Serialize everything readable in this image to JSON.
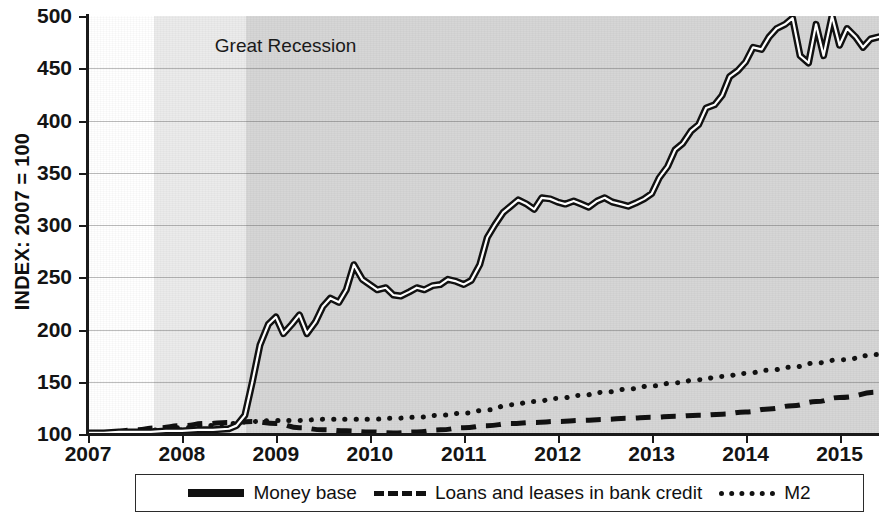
{
  "chart_data": {
    "type": "line",
    "title": "",
    "xlabel": "",
    "ylabel": "INDEX: 2007 = 100",
    "xlim": [
      2007,
      2015.42
    ],
    "ylim": [
      100,
      500
    ],
    "yticks": [
      100,
      150,
      200,
      250,
      300,
      350,
      400,
      450,
      500
    ],
    "xticks": [
      "2007",
      "2008",
      "2009",
      "2010",
      "2011",
      "2012",
      "2013",
      "2014",
      "2015"
    ],
    "grid": true,
    "legend_position": "bottom",
    "annotations": [
      {
        "text": "Great Recession",
        "x": 2008.35,
        "y": 470
      }
    ],
    "shaded_regions": [
      {
        "name": "recession-light-band",
        "x0": 2007.7,
        "x1": 2008.68,
        "color": "#ebebeb"
      },
      {
        "name": "post-recession-dark-band",
        "x0": 2008.68,
        "x1": 2015.42,
        "color": "#d6d6d6"
      }
    ],
    "series": [
      {
        "name": "Money base",
        "style": "solid",
        "color": "#111111",
        "x": [
          2007.0,
          2007.17,
          2007.33,
          2007.5,
          2007.67,
          2007.83,
          2008.0,
          2008.17,
          2008.33,
          2008.5,
          2008.58,
          2008.67,
          2008.75,
          2008.83,
          2008.92,
          2009.0,
          2009.08,
          2009.17,
          2009.25,
          2009.33,
          2009.42,
          2009.5,
          2009.58,
          2009.67,
          2009.75,
          2009.83,
          2009.92,
          2010.0,
          2010.08,
          2010.17,
          2010.25,
          2010.33,
          2010.42,
          2010.5,
          2010.58,
          2010.67,
          2010.75,
          2010.83,
          2010.92,
          2011.0,
          2011.08,
          2011.17,
          2011.25,
          2011.33,
          2011.42,
          2011.5,
          2011.58,
          2011.67,
          2011.75,
          2011.83,
          2011.92,
          2012.0,
          2012.08,
          2012.17,
          2012.25,
          2012.33,
          2012.42,
          2012.5,
          2012.58,
          2012.67,
          2012.75,
          2012.83,
          2012.92,
          2013.0,
          2013.08,
          2013.17,
          2013.25,
          2013.33,
          2013.42,
          2013.5,
          2013.58,
          2013.67,
          2013.75,
          2013.83,
          2013.92,
          2014.0,
          2014.08,
          2014.17,
          2014.25,
          2014.33,
          2014.42,
          2014.5,
          2014.58,
          2014.67,
          2014.75,
          2014.83,
          2014.92,
          2015.0,
          2015.08,
          2015.17,
          2015.25,
          2015.33,
          2015.42
        ],
        "values": [
          101,
          101,
          102,
          102,
          102,
          103,
          103,
          104,
          104,
          105,
          108,
          118,
          150,
          185,
          205,
          212,
          196,
          205,
          214,
          196,
          207,
          222,
          230,
          226,
          238,
          262,
          248,
          243,
          238,
          240,
          233,
          232,
          236,
          240,
          238,
          242,
          243,
          248,
          246,
          243,
          247,
          262,
          288,
          300,
          312,
          318,
          324,
          320,
          315,
          326,
          325,
          322,
          320,
          323,
          320,
          317,
          323,
          326,
          322,
          320,
          318,
          321,
          325,
          330,
          345,
          356,
          372,
          378,
          390,
          396,
          412,
          415,
          424,
          442,
          448,
          456,
          470,
          468,
          480,
          488,
          492,
          498,
          462,
          455,
          492,
          462,
          500,
          472,
          488,
          480,
          470,
          478,
          480
        ],
        "note": "Monetary base, double-stroke black line"
      },
      {
        "name": "Loans and leases in bank credit",
        "style": "dashed",
        "color": "#111111",
        "x": [
          2007.0,
          2007.25,
          2007.5,
          2007.75,
          2008.0,
          2008.25,
          2008.5,
          2008.75,
          2009.0,
          2009.25,
          2009.5,
          2009.75,
          2010.0,
          2010.25,
          2010.5,
          2010.75,
          2011.0,
          2011.25,
          2011.5,
          2011.75,
          2012.0,
          2012.25,
          2012.5,
          2012.75,
          2013.0,
          2013.25,
          2013.5,
          2013.75,
          2014.0,
          2014.25,
          2014.5,
          2014.75,
          2015.0,
          2015.42
        ],
        "values": [
          100,
          102,
          104,
          106,
          108,
          110,
          111,
          112,
          110,
          106,
          104,
          103,
          102,
          101,
          102,
          104,
          106,
          108,
          110,
          111,
          112,
          113,
          114,
          115,
          116,
          117,
          118,
          119,
          121,
          124,
          127,
          131,
          135,
          140
        ]
      },
      {
        "name": "M2",
        "style": "dotted",
        "color": "#111111",
        "x": [
          2007.0,
          2007.25,
          2007.5,
          2007.75,
          2008.0,
          2008.25,
          2008.5,
          2008.75,
          2009.0,
          2009.25,
          2009.5,
          2009.75,
          2010.0,
          2010.25,
          2010.5,
          2010.75,
          2011.0,
          2011.25,
          2011.5,
          2011.75,
          2012.0,
          2012.25,
          2012.5,
          2012.75,
          2013.0,
          2013.25,
          2013.5,
          2013.75,
          2014.0,
          2014.25,
          2014.5,
          2014.75,
          2015.0,
          2015.42
        ],
        "values": [
          100,
          101,
          102,
          104,
          106,
          108,
          110,
          112,
          113,
          113,
          114,
          114,
          114,
          115,
          116,
          118,
          120,
          123,
          128,
          131,
          134,
          137,
          140,
          143,
          146,
          149,
          152,
          155,
          158,
          161,
          164,
          168,
          171,
          176
        ]
      }
    ]
  },
  "axis": {
    "y_label": "INDEX: 2007 = 100",
    "y_ticks": [
      "500",
      "450",
      "400",
      "350",
      "300",
      "250",
      "200",
      "150",
      "100"
    ],
    "x_ticks": [
      "2007",
      "2008",
      "2009",
      "2010",
      "2011",
      "2012",
      "2013",
      "2014",
      "2015"
    ]
  },
  "annotation": {
    "recession": "Great Recession"
  },
  "legend": {
    "items": [
      {
        "label": "Money base",
        "style": "solid"
      },
      {
        "label": "Loans and leases in bank credit",
        "style": "dashed"
      },
      {
        "label": "M2",
        "style": "dotted"
      }
    ]
  },
  "colors": {
    "line": "#111111",
    "band_light": "#ebebeb",
    "band_dark": "#d6d6d6",
    "grid": "#8c8c8c",
    "axis": "#1a1a1a"
  }
}
